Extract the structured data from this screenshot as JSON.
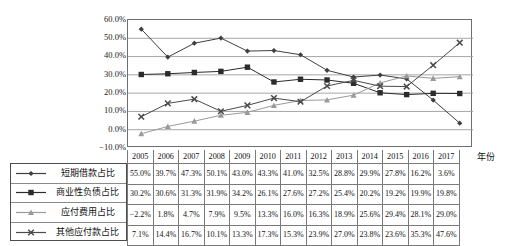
{
  "chart_data": {
    "type": "line",
    "title": "",
    "xlabel": "年份",
    "ylabel": "",
    "categories": [
      "2005",
      "2006",
      "2007",
      "2008",
      "2009",
      "2010",
      "2011",
      "2012",
      "2013",
      "2014",
      "2015",
      "2016",
      "2017"
    ],
    "ylim": [
      -10,
      60
    ],
    "ytick_labels": [
      "60.0%",
      "50.0%",
      "40.0%",
      "30.0%",
      "20.0%",
      "10.0%",
      "0.0%",
      "-10.0%"
    ],
    "ytick_values": [
      60,
      50,
      40,
      30,
      20,
      10,
      0,
      -10
    ],
    "grid": true,
    "legend_position": "bottom-left",
    "series": [
      {
        "name": "短期借款占比",
        "marker": "diamond",
        "color": "#3f3f3f",
        "values": [
          55.0,
          39.7,
          47.3,
          50.1,
          43.0,
          43.3,
          41.0,
          32.5,
          28.8,
          29.9,
          27.8,
          16.2,
          3.6
        ],
        "labels": [
          "55.0%",
          "39.7%",
          "47.3%",
          "50.1%",
          "43.0%",
          "43.3%",
          "41.0%",
          "32.5%",
          "28.8%",
          "29.9%",
          "27.8%",
          "16.2%",
          "3.6%"
        ]
      },
      {
        "name": "商业性负债占比",
        "marker": "square",
        "color": "#2b2b2b",
        "values": [
          30.2,
          30.6,
          31.3,
          31.9,
          34.2,
          26.1,
          27.6,
          27.2,
          25.4,
          20.2,
          19.2,
          19.9,
          19.8
        ],
        "labels": [
          "30.2%",
          "30.6%",
          "31.3%",
          "31.9%",
          "34.2%",
          "26.1%",
          "27.6%",
          "27.2%",
          "25.4%",
          "20.2%",
          "19.2%",
          "19.9%",
          "19.8%"
        ]
      },
      {
        "name": "应付费用占比",
        "marker": "triangle",
        "color": "#9a9a9a",
        "values": [
          -2.2,
          1.8,
          4.7,
          7.9,
          9.5,
          13.3,
          16.0,
          16.3,
          18.9,
          25.6,
          29.4,
          28.1,
          29.0
        ],
        "labels": [
          "-2.2%",
          "1.8%",
          "4.7%",
          "7.9%",
          "9.5%",
          "13.3%",
          "16.0%",
          "16.3%",
          "18.9%",
          "25.6%",
          "29.4%",
          "28.1%",
          "29.0%"
        ]
      },
      {
        "name": "其他应付款占比",
        "marker": "x",
        "color": "#4a4a4a",
        "values": [
          7.1,
          14.4,
          16.7,
          10.1,
          13.3,
          17.3,
          15.3,
          23.9,
          27.0,
          23.8,
          23.6,
          35.3,
          47.6
        ],
        "labels": [
          "7.1%",
          "14.4%",
          "16.7%",
          "10.1%",
          "13.3%",
          "17.3%",
          "15.3%",
          "23.9%",
          "27.0%",
          "23.8%",
          "23.6%",
          "35.3%",
          "47.6%"
        ]
      }
    ]
  },
  "legend": {
    "items": [
      {
        "label": "短期借款占比",
        "marker": "diamond"
      },
      {
        "label": "商业性负债占比",
        "marker": "square"
      },
      {
        "label": "应付费用占比",
        "marker": "triangle"
      },
      {
        "label": "其他应付款占比",
        "marker": "x"
      }
    ]
  },
  "table": {
    "header": [
      "2005",
      "2006",
      "2007",
      "2008",
      "2009",
      "2010",
      "2011",
      "2012",
      "2013",
      "2014",
      "2015",
      "2016",
      "2017"
    ],
    "axis_title": "年份",
    "rows": [
      {
        "name": "短期借款占比",
        "cells": [
          "55.0%",
          "39.7%",
          "47.3%",
          "50.1%",
          "43.0%",
          "43.3%",
          "41.0%",
          "32.5%",
          "28.8%",
          "29.9%",
          "27.8%",
          "16.2%",
          "3.6%"
        ]
      },
      {
        "name": "商业性负债占比",
        "cells": [
          "30.2%",
          "30.6%",
          "31.3%",
          "31.9%",
          "34.2%",
          "26.1%",
          "27.6%",
          "27.2%",
          "25.4%",
          "20.2%",
          "19.2%",
          "19.9%",
          "19.8%"
        ]
      },
      {
        "name": "应付费用占比",
        "cells": [
          "-2.2%",
          "1.8%",
          "4.7%",
          "7.9%",
          "9.5%",
          "13.3%",
          "16.0%",
          "16.3%",
          "18.9%",
          "25.6%",
          "29.4%",
          "28.1%",
          "29.0%"
        ]
      },
      {
        "name": "其他应付款占比",
        "cells": [
          "7.1%",
          "14.4%",
          "16.7%",
          "10.1%",
          "13.3%",
          "17.3%",
          "15.3%",
          "23.9%",
          "27.0%",
          "23.8%",
          "23.6%",
          "35.3%",
          "47.6%"
        ]
      }
    ]
  },
  "axis": {
    "y_labels": [
      "60.0%",
      "50.0%",
      "40.0%",
      "30.0%",
      "20.0%",
      "10.0%",
      "0.0%",
      "-10.0%"
    ]
  }
}
